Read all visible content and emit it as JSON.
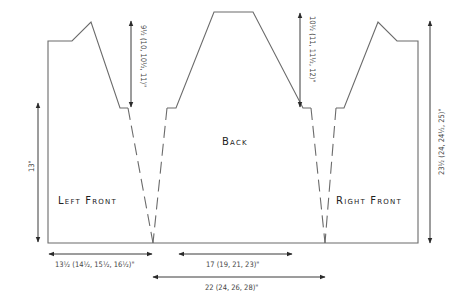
{
  "diagram": {
    "type": "knitting-schematic",
    "pieces": {
      "left_front": {
        "label": "Left Front"
      },
      "back": {
        "label": "Back"
      },
      "right_front": {
        "label": "Right Front"
      }
    },
    "dimensions": {
      "front_armhole_depth": "9½ (10, 10½, 11)\"",
      "back_armhole_depth": "10½ (11, 11½, 12)\"",
      "total_length": "23½ (24, 24½, 25)\"",
      "side_length": "13\"",
      "front_width": "13½ (14½, 15½, 16½)\"",
      "back_width": "17 (19, 21, 23)\"",
      "back_lower_width": "22 (24, 26, 28)\""
    },
    "colors": {
      "outline": "#6b6b6b",
      "arrows": "#3a3a3a",
      "text": "#222222"
    }
  }
}
